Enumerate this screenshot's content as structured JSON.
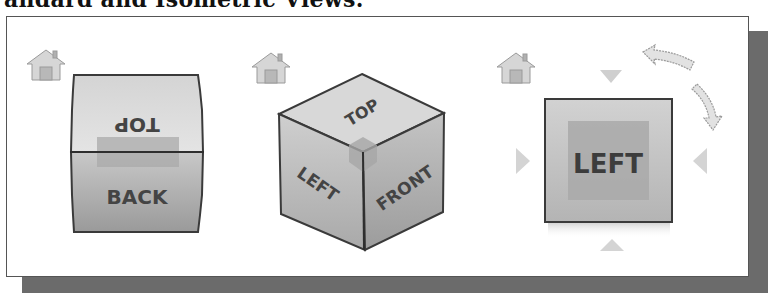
{
  "caption": "andard and Isometric Views.",
  "panels": [
    {
      "name": "top-back-view",
      "home_icon": "home-icon",
      "faces": {
        "top": "TOP",
        "back": "BACK"
      }
    },
    {
      "name": "isometric-view",
      "home_icon": "home-icon",
      "faces": {
        "top": "TOP",
        "left": "LEFT",
        "front": "FRONT"
      }
    },
    {
      "name": "left-view",
      "home_icon": "home-icon",
      "faces": {
        "left": "LEFT"
      },
      "controls": [
        "arrow-down-icon",
        "arrow-right-icon",
        "arrow-left-icon",
        "arrow-up-icon",
        "rotate-ccw-icon",
        "rotate-cw-icon"
      ]
    }
  ],
  "colors": {
    "face_light": "#d9d9d9",
    "face_mid": "#bdbdbd",
    "face_dark": "#9a9a9a",
    "edge": "#3a3a3a",
    "highlight": "#a8a8a8",
    "control": "#d0d0d0",
    "shadow": "#6b6b6b"
  }
}
